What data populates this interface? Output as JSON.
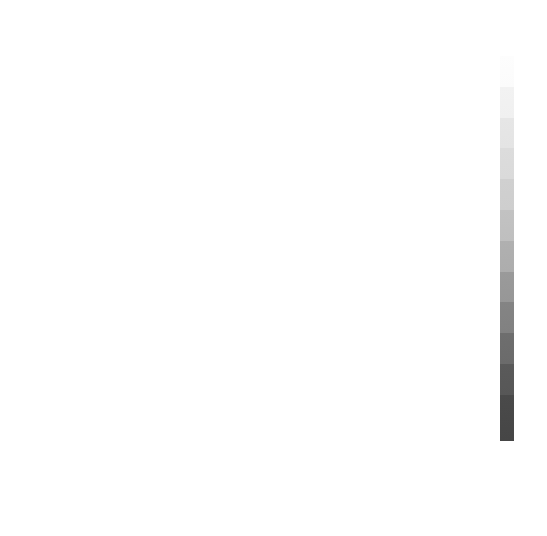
{
  "figure": {
    "axis_labels": {
      "x": "经度",
      "y": "纬度"
    },
    "xticks": [
      "-150",
      "-100",
      "-50",
      "0",
      "50",
      "100",
      "150"
    ],
    "yticks": [
      "50",
      "0",
      "-50"
    ]
  },
  "panels": [
    {
      "id": "a",
      "caption": "(a)2012年JJA期间SPI",
      "index": "SPI",
      "year": "2012",
      "season": "JJA",
      "has_boxes": true
    },
    {
      "id": "b",
      "caption": "(b)2012年JJA期间STI",
      "index": "STI",
      "year": "2012",
      "season": "JJA",
      "has_boxes": false
    },
    {
      "id": "c",
      "caption": "(c)2012年JJA期间SCEI",
      "index": "SCEI",
      "year": "2012",
      "season": "JJA",
      "has_boxes": false
    },
    {
      "id": "d",
      "caption": "(d)2012年JJA期间BDHI",
      "index": "BDHI",
      "year": "2012",
      "season": "JJA",
      "has_boxes": false
    },
    {
      "id": "e",
      "caption": "(e)2018年JJA期间SPI",
      "index": "SPI",
      "year": "2018",
      "season": "JJA",
      "has_boxes": false
    },
    {
      "id": "f",
      "caption": "(f)2018年JJA期间STI",
      "index": "STI",
      "year": "2018",
      "season": "JJA",
      "has_boxes": false
    },
    {
      "id": "g",
      "caption": "(g)2018年JJA期间SCEI",
      "index": "SCEI",
      "year": "2018",
      "season": "JJA",
      "has_boxes": false
    },
    {
      "id": "h",
      "caption": "(h)2018年JJA期间BDHI",
      "index": "BDHI",
      "year": "2018",
      "season": "JJA",
      "has_boxes": false
    }
  ],
  "colorbar": {
    "ticks": [
      "2.5",
      "2.0",
      "1.5",
      "1.0",
      "0.5",
      "0",
      "-0.5",
      "-1.0",
      "-1.5",
      "-2.0",
      "-2.5"
    ],
    "vmin": -2.5,
    "vmax": 2.5,
    "colormap": "grayscale",
    "high_color": "#fdfdfd",
    "low_color": "#464646"
  },
  "chart_data": {
    "type": "heatmap",
    "title": "",
    "xlabel": "经度",
    "ylabel": "纬度",
    "xlim": [
      -180,
      180
    ],
    "ylim": [
      -60,
      85
    ],
    "xticks": [
      -150,
      -100,
      -50,
      0,
      50,
      100,
      150
    ],
    "yticks": [
      -50,
      0,
      50
    ],
    "grid": false,
    "legend": "colorbar-right",
    "colorbar": {
      "vmin": -2.5,
      "vmax": 2.5,
      "ticks": [
        2.5,
        2.0,
        1.5,
        1.0,
        0.5,
        0,
        -0.5,
        -1.0,
        -1.5,
        -2.0,
        -2.5
      ],
      "colormap": "grayscale_reversed"
    },
    "panels": [
      {
        "id": "a",
        "label": "(a)2012年JJA期间SPI",
        "variable": "SPI",
        "year": 2012,
        "season": "JJA"
      },
      {
        "id": "b",
        "label": "(b)2012年JJA期间STI",
        "variable": "STI",
        "year": 2012,
        "season": "JJA"
      },
      {
        "id": "c",
        "label": "(c)2012年JJA期间SCEI",
        "variable": "SCEI",
        "year": 2012,
        "season": "JJA"
      },
      {
        "id": "d",
        "label": "(d)2012年JJA期间BDHI",
        "variable": "BDHI",
        "year": 2012,
        "season": "JJA"
      },
      {
        "id": "e",
        "label": "(e)2018年JJA期间SPI",
        "variable": "SPI",
        "year": 2018,
        "season": "JJA"
      },
      {
        "id": "f",
        "label": "(f)2018年JJA期间STI",
        "variable": "STI",
        "year": 2018,
        "season": "JJA"
      },
      {
        "id": "g",
        "label": "(g)2018年JJA期间SCEI",
        "variable": "SCEI",
        "year": 2018,
        "season": "JJA"
      },
      {
        "id": "h",
        "label": "(h)2018年JJA期间BDHI",
        "variable": "BDHI",
        "year": 2018,
        "season": "JJA"
      }
    ],
    "highlight_boxes": [
      {
        "name": "central-north-america",
        "lon": [
          -110,
          -88
        ],
        "lat": [
          33,
          48
        ]
      },
      {
        "name": "south-america",
        "lon": [
          -72,
          -45
        ],
        "lat": [
          -23,
          -5
        ]
      },
      {
        "name": "europe",
        "lon": [
          -6,
          38
        ],
        "lat": [
          44,
          70
        ]
      },
      {
        "name": "central-africa",
        "lon": [
          12,
          36
        ],
        "lat": [
          -37,
          -18
        ]
      },
      {
        "name": "east-asia",
        "lon": [
          108,
          128
        ],
        "lat": [
          27,
          40
        ]
      },
      {
        "name": "australia",
        "lon": [
          114,
          154
        ],
        "lat": [
          -38,
          -20
        ]
      }
    ]
  }
}
